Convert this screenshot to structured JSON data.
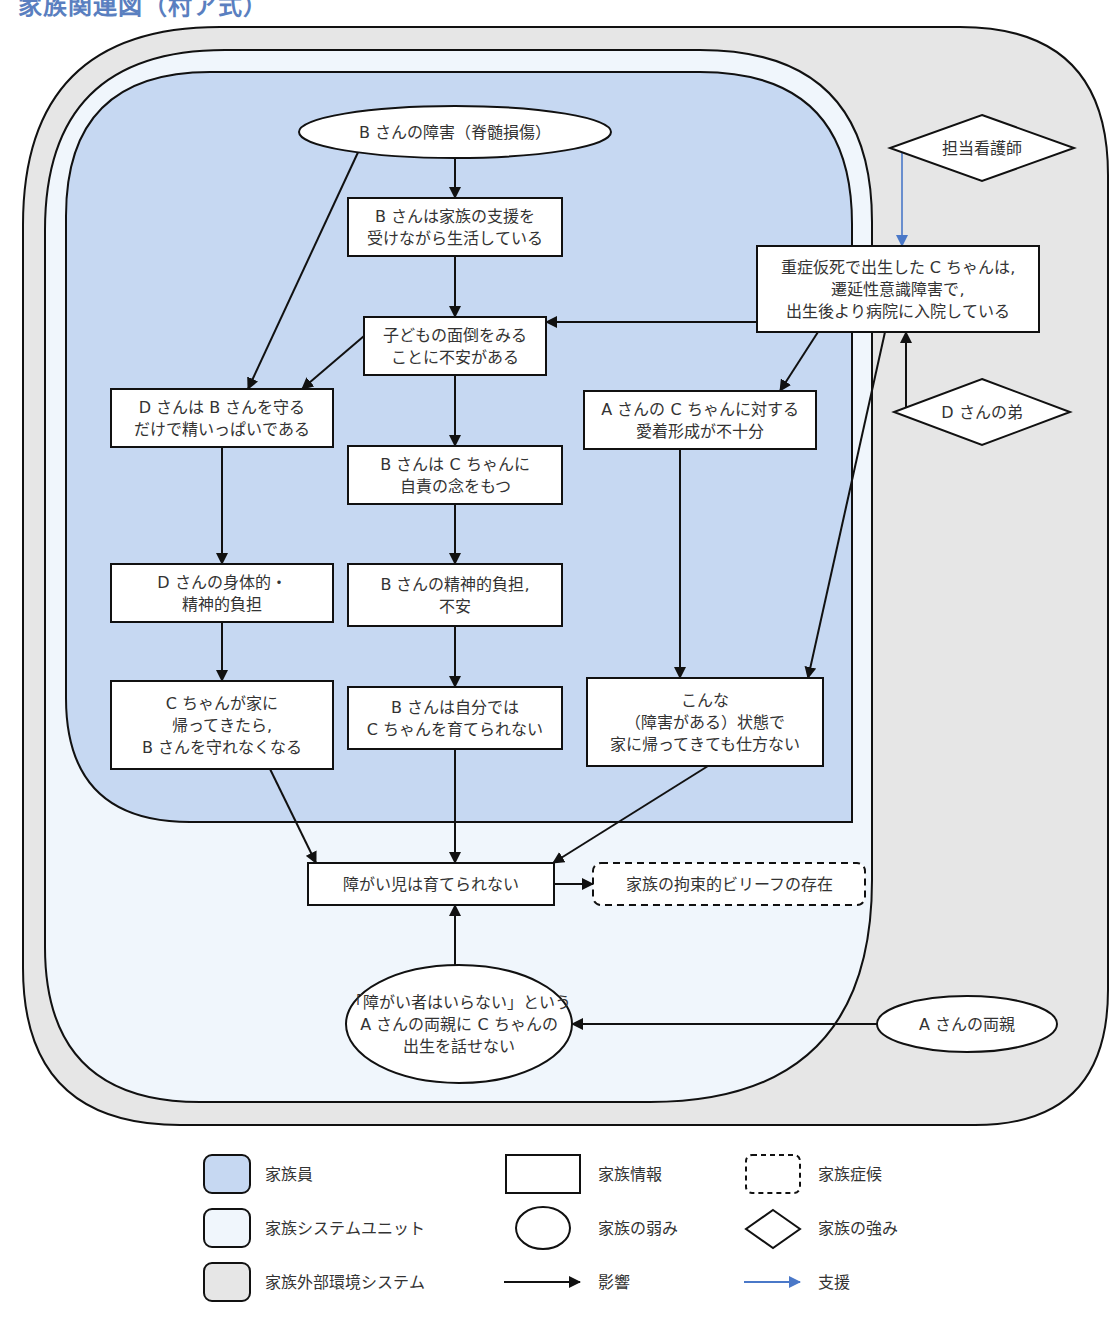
{
  "title": "家族関連図（村ア式）",
  "colors": {
    "family_member": "#c6d8f2",
    "family_system_unit": "#f0f6fc",
    "external_environment": "#e6e6e6",
    "influence_arrow": "#111111",
    "support_arrow": "#4a78c8",
    "title": "#5a7fc0"
  },
  "regions": {
    "external_environment": "家族外部環境システム",
    "family_system_unit": "家族システムユニット",
    "family_member": "家族員"
  },
  "nodes": {
    "b_disability": {
      "shape": "ellipse",
      "category": "家族の弱み",
      "lines": [
        "B さんの障害（脊髄損傷）"
      ]
    },
    "b_support": {
      "shape": "rect",
      "category": "家族情報",
      "lines": [
        "B さんは家族の支援を",
        "受けながら生活している"
      ]
    },
    "childcare_anxiety": {
      "shape": "rect",
      "category": "家族情報",
      "lines": [
        "子どもの面倒をみる",
        "ことに不安がある"
      ]
    },
    "c_hospitalized": {
      "shape": "rect",
      "category": "家族情報",
      "lines": [
        "重症仮死で出生した C ちゃんは,",
        "遷延性意識障害で,",
        "出生後より病院に入院している"
      ]
    },
    "nurse": {
      "shape": "diamond",
      "category": "家族の強み",
      "lines": [
        "担当看護師"
      ]
    },
    "d_brother": {
      "shape": "diamond",
      "category": "家族の強み",
      "lines": [
        "D さんの弟"
      ]
    },
    "d_protects_b": {
      "shape": "rect",
      "category": "家族情報",
      "lines": [
        "D さんは B さんを守る",
        "だけで精いっぱいである"
      ]
    },
    "b_guilt": {
      "shape": "rect",
      "category": "家族情報",
      "lines": [
        "B さんは C ちゃんに",
        "自責の念をもつ"
      ]
    },
    "a_attachment": {
      "shape": "rect",
      "category": "家族情報",
      "lines": [
        "A さんの C ちゃんに対する",
        "愛着形成が不十分"
      ]
    },
    "d_burden": {
      "shape": "rect",
      "category": "家族情報",
      "lines": [
        "D さんの身体的・",
        "精神的負担"
      ]
    },
    "b_burden": {
      "shape": "rect",
      "category": "家族情報",
      "lines": [
        "B さんの精神的負担,",
        "不安"
      ]
    },
    "c_home_d": {
      "shape": "rect",
      "category": "家族情報",
      "lines": [
        "C ちゃんが家に",
        "帰ってきたら,",
        "B さんを守れなくなる"
      ]
    },
    "b_cannot_raise": {
      "shape": "rect",
      "category": "家族情報",
      "lines": [
        "B さんは自分では",
        "C ちゃんを育てられない"
      ]
    },
    "cannot_help": {
      "shape": "rect",
      "category": "家族情報",
      "lines": [
        "こんな",
        "（障害がある）状態で",
        "家に帰ってきても仕方ない"
      ]
    },
    "cannot_raise_disabled": {
      "shape": "rect",
      "category": "家族情報",
      "lines": [
        "障がい児は育てられない"
      ]
    },
    "constraining_belief": {
      "shape": "dashed-rect",
      "category": "家族症候",
      "lines": [
        "家族の拘束的ビリーフの存在"
      ]
    },
    "cannot_tell_parents": {
      "shape": "ellipse",
      "category": "家族の弱み",
      "lines": [
        "「障がい者はいらない」という",
        "A さんの両親に C ちゃんの",
        "出生を話せない"
      ]
    },
    "a_parents": {
      "shape": "ellipse",
      "category": "家族の弱み",
      "lines": [
        "A さんの両親"
      ]
    }
  },
  "edges": [
    {
      "from": "b_disability",
      "to": "b_support",
      "type": "影響"
    },
    {
      "from": "b_disability",
      "to": "d_protects_b",
      "type": "影響"
    },
    {
      "from": "b_support",
      "to": "childcare_anxiety",
      "type": "影響"
    },
    {
      "from": "c_hospitalized",
      "to": "childcare_anxiety",
      "type": "影響"
    },
    {
      "from": "c_hospitalized",
      "to": "a_attachment",
      "type": "影響"
    },
    {
      "from": "c_hospitalized",
      "to": "cannot_help",
      "type": "影響"
    },
    {
      "from": "nurse",
      "to": "c_hospitalized",
      "type": "支援"
    },
    {
      "from": "d_brother",
      "to": "c_hospitalized",
      "type": "影響"
    },
    {
      "from": "childcare_anxiety",
      "to": "d_protects_b",
      "type": "影響"
    },
    {
      "from": "childcare_anxiety",
      "to": "b_guilt",
      "type": "影響"
    },
    {
      "from": "d_protects_b",
      "to": "d_burden",
      "type": "影響"
    },
    {
      "from": "b_guilt",
      "to": "b_burden",
      "type": "影響"
    },
    {
      "from": "a_attachment",
      "to": "cannot_help",
      "type": "影響"
    },
    {
      "from": "d_burden",
      "to": "c_home_d",
      "type": "影響"
    },
    {
      "from": "b_burden",
      "to": "b_cannot_raise",
      "type": "影響"
    },
    {
      "from": "c_home_d",
      "to": "cannot_raise_disabled",
      "type": "影響"
    },
    {
      "from": "b_cannot_raise",
      "to": "cannot_raise_disabled",
      "type": "影響"
    },
    {
      "from": "cannot_help",
      "to": "cannot_raise_disabled",
      "type": "影響"
    },
    {
      "from": "cannot_raise_disabled",
      "to": "constraining_belief",
      "type": "影響"
    },
    {
      "from": "cannot_tell_parents",
      "to": "cannot_raise_disabled",
      "type": "影響"
    },
    {
      "from": "a_parents",
      "to": "cannot_tell_parents",
      "type": "影響"
    }
  ],
  "legend": {
    "family_member": "家族員",
    "family_system_unit": "家族システムユニット",
    "external_environment": "家族外部環境システム",
    "family_info": "家族情報",
    "family_weakness": "家族の弱み",
    "influence": "影響",
    "family_symptom": "家族症候",
    "family_strength": "家族の強み",
    "support": "支援"
  }
}
